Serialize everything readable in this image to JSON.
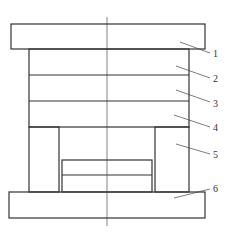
{
  "diagram": {
    "type": "mold-assembly-cross-section",
    "colors": {
      "stroke": "#333333",
      "background": "#ffffff"
    },
    "parts": [
      {
        "id": "1",
        "label": "1",
        "name": "top-plate"
      },
      {
        "id": "2",
        "label": "2",
        "name": "plate-2"
      },
      {
        "id": "3",
        "label": "3",
        "name": "plate-3"
      },
      {
        "id": "4",
        "label": "4",
        "name": "plate-4"
      },
      {
        "id": "5",
        "label": "5",
        "name": "support-block"
      },
      {
        "id": "6",
        "label": "6",
        "name": "bottom-plate"
      }
    ]
  }
}
